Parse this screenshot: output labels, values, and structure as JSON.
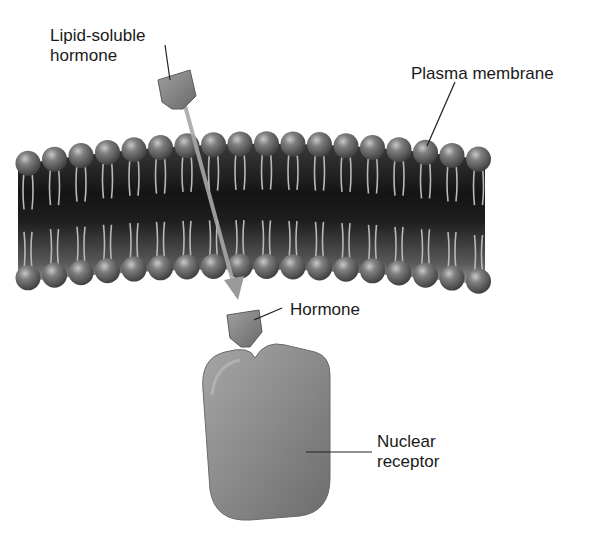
{
  "diagram": {
    "labels": {
      "lipid_soluble_hormone": "Lipid-soluble\nhormone",
      "plasma_membrane": "Plasma membrane",
      "hormone": "Hormone",
      "nuclear_receptor": "Nuclear\nreceptor"
    },
    "colors": {
      "background": "#ffffff",
      "membrane_core": "#1c1c1c",
      "phospholipid_head": "#6e6e6e",
      "hormone": "#8a8a8a",
      "receptor": "#8c8c8c",
      "arrow": "#a8a8a8",
      "text": "#1a1a1a"
    },
    "components": [
      {
        "id": "plasma-membrane",
        "description": "Phospholipid bilayer with two rows of heads and lipid tails"
      },
      {
        "id": "lipid-soluble-hormone",
        "description": "Hormone outside the cell"
      },
      {
        "id": "arrow",
        "description": "Path of hormone diffusing through membrane"
      },
      {
        "id": "hormone-inside",
        "description": "Hormone inside the cell approaching receptor"
      },
      {
        "id": "nuclear-receptor",
        "description": "Receptor with binding notch"
      }
    ]
  }
}
